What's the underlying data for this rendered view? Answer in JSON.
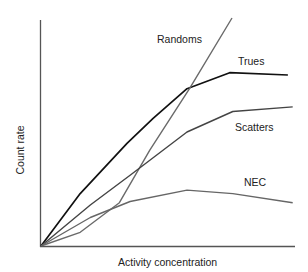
{
  "chart_data": {
    "type": "line",
    "title": "",
    "xlabel": "Activity concentration",
    "ylabel": "Count rate",
    "grid": false,
    "legend": "inline labels",
    "axes": {
      "ticks": false,
      "xlim": [
        0,
        1
      ],
      "ylim": [
        0,
        1
      ]
    },
    "series": [
      {
        "name": "Trues",
        "color": "#111111",
        "points": [
          [
            0,
            0
          ],
          [
            0.155,
            0.23
          ],
          [
            0.34,
            0.45
          ],
          [
            0.443,
            0.56
          ],
          [
            0.577,
            0.69
          ],
          [
            0.746,
            0.76
          ],
          [
            0.976,
            0.75
          ]
        ]
      },
      {
        "name": "Randoms",
        "color": "#6a6a6a",
        "points": [
          [
            0,
            0
          ],
          [
            0.155,
            0.06
          ],
          [
            0.31,
            0.19
          ],
          [
            0.43,
            0.42
          ],
          [
            0.587,
            0.69
          ],
          [
            0.755,
            1.0
          ]
        ]
      },
      {
        "name": "Scatters",
        "color": "#444444",
        "points": [
          [
            0,
            0
          ],
          [
            0.195,
            0.18
          ],
          [
            0.352,
            0.31
          ],
          [
            0.577,
            0.5
          ],
          [
            0.758,
            0.59
          ],
          [
            0.995,
            0.61
          ]
        ]
      },
      {
        "name": "NEC",
        "color": "#666666",
        "points": [
          [
            0,
            0
          ],
          [
            0.195,
            0.125
          ],
          [
            0.352,
            0.195
          ],
          [
            0.577,
            0.245
          ],
          [
            0.758,
            0.23
          ],
          [
            0.995,
            0.19
          ]
        ]
      }
    ],
    "annotations": [
      {
        "text": "Randoms",
        "x": 157,
        "y": 33
      },
      {
        "text": "Trues",
        "x": 238,
        "y": 55
      },
      {
        "text": "Scatters",
        "x": 235,
        "y": 121
      },
      {
        "text": "NEC",
        "x": 244,
        "y": 176
      }
    ]
  },
  "labels": {
    "randoms": "Randoms",
    "trues": "Trues",
    "scatters": "Scatters",
    "nec": "NEC",
    "xlabel": "Activity concentration",
    "ylabel": "Count rate"
  }
}
